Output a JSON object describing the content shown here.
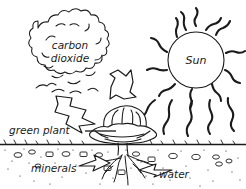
{
  "diagram": {
    "background_color": "#ffffff",
    "ink_color": "#1a1a1a",
    "labels": {
      "carbon_dioxide_line1": "carbon",
      "carbon_dioxide_line2": "dioxide",
      "sun": "Sun",
      "green_plant": "green plant",
      "minerals": "minerals",
      "water": "water"
    },
    "elements": {
      "cloud_name": "carbon-dioxide-cloud",
      "sun_name": "sun-disc",
      "plant_name": "green-plant",
      "soil_name": "soil-layer",
      "ground_name": "ground-line"
    },
    "arrows": {
      "co2_to_plant": "carbon dioxide enters the plant",
      "co2_to_plant_secondary": "carbon dioxide enters the plant",
      "minerals_to_roots": "minerals taken up by roots",
      "water_to_roots": "water taken up by roots"
    },
    "counts": {
      "sun_rays": 12,
      "light_beams": 5
    }
  }
}
